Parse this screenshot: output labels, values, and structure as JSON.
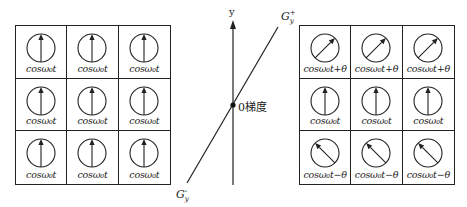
{
  "figure": {
    "left_grid": {
      "cells": [
        {
          "label": "cosω₀t",
          "angle_deg": 0
        },
        {
          "label": "cosω₀t",
          "angle_deg": 0
        },
        {
          "label": "cosω₀t",
          "angle_deg": 0
        },
        {
          "label": "cosω₀t",
          "angle_deg": 0
        },
        {
          "label": "cosω₀t",
          "angle_deg": 0
        },
        {
          "label": "cosω₀t",
          "angle_deg": 0
        },
        {
          "label": "cosω₀t",
          "angle_deg": 0
        },
        {
          "label": "cosω₀t",
          "angle_deg": 0
        },
        {
          "label": "cosω₀t",
          "angle_deg": 0
        }
      ]
    },
    "center": {
      "y_axis_label": "y",
      "gradient_plus_label": "G",
      "gradient_plus_sub": "y",
      "gradient_plus_sup": "+",
      "gradient_minus_label": "G",
      "gradient_minus_sub": "y",
      "gradient_minus_sup": "-",
      "zero_label": "0梯度"
    },
    "right_grid": {
      "cells": [
        {
          "label": "cosω₀t+θ",
          "angle_deg": 45
        },
        {
          "label": "cosω₀t+θ",
          "angle_deg": 45
        },
        {
          "label": "cosω₀t+θ",
          "angle_deg": 45
        },
        {
          "label": "cosω₀t",
          "angle_deg": 0
        },
        {
          "label": "cosω₀t",
          "angle_deg": 0
        },
        {
          "label": "cosω₀t",
          "angle_deg": 0
        },
        {
          "label": "cosω₀t−θ",
          "angle_deg": -45
        },
        {
          "label": "cosω₀t−θ",
          "angle_deg": -45
        },
        {
          "label": "cosω₀t−θ",
          "angle_deg": -45
        }
      ]
    },
    "colors": {
      "line": "#222222",
      "background": "#ffffff"
    }
  }
}
